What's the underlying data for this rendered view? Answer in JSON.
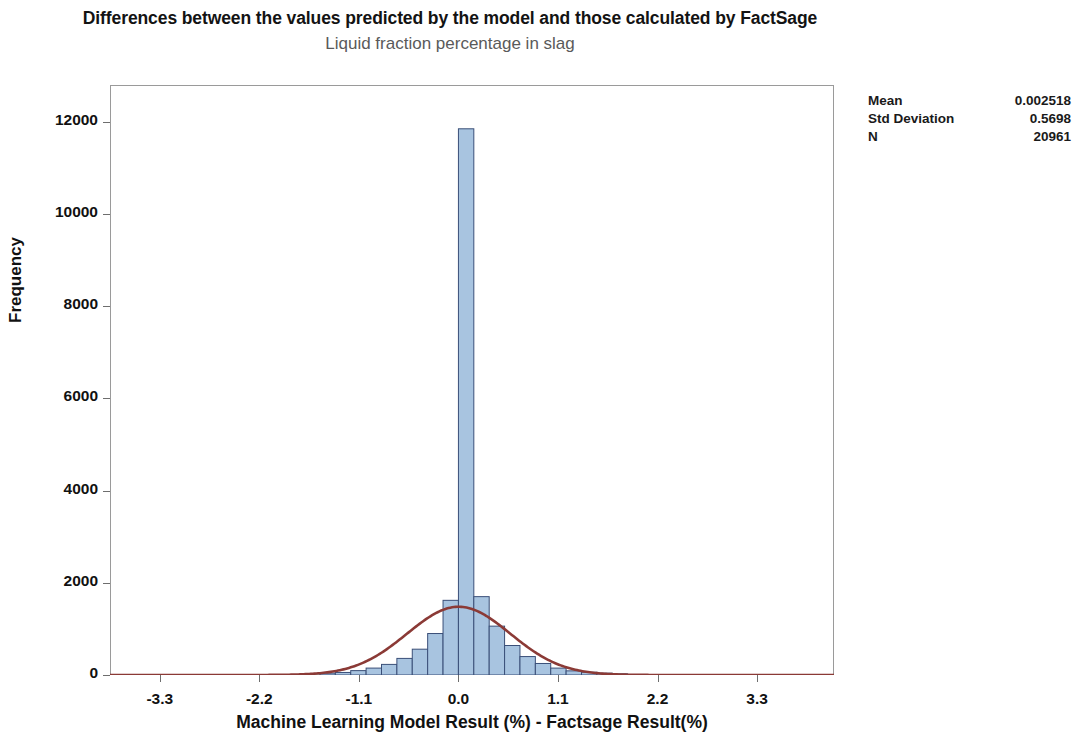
{
  "chart_data": {
    "type": "bar",
    "title": "Differences between the values predicted by the model and those calculated by FactSage",
    "subtitle": "Liquid fraction percentage in slag",
    "xlabel": "Machine Learning Model Result (%) - Factsage Result(%)",
    "ylabel": "Frequency",
    "xlim": [
      -3.85,
      4.15
    ],
    "ylim": [
      0,
      12800
    ],
    "grid": false,
    "legend": "none",
    "bar_color": "#A8C4E0",
    "bar_edge_color": "#3A4F78",
    "curve_color": "#8B3A36",
    "frame_color": "#9A9A9A",
    "xticks": [
      "-3.3",
      "-2.2",
      "-1.1",
      "0.0",
      "1.1",
      "2.2",
      "3.3"
    ],
    "xtick_values": [
      -3.3,
      -2.2,
      -1.1,
      0.0,
      1.1,
      2.2,
      3.3
    ],
    "yticks": [
      "0",
      "2000",
      "4000",
      "6000",
      "8000",
      "10000",
      "12000"
    ],
    "ytick_values": [
      0,
      2000,
      4000,
      6000,
      8000,
      10000,
      12000
    ],
    "bin_width": 0.17,
    "bin_centers": [
      -1.445,
      -1.275,
      -1.105,
      -0.935,
      -0.765,
      -0.595,
      -0.425,
      -0.255,
      -0.085,
      0.085,
      0.255,
      0.425,
      0.595,
      0.765,
      0.935,
      1.105,
      1.275,
      1.445,
      1.615,
      1.785
    ],
    "bin_left_edges": [
      -1.53,
      -1.36,
      -1.19,
      -1.02,
      -0.85,
      -0.68,
      -0.51,
      -0.34,
      -0.17,
      0.0,
      0.17,
      0.34,
      0.51,
      0.68,
      0.85,
      1.02,
      1.19,
      1.36,
      1.53,
      1.7
    ],
    "values": [
      40,
      55,
      95,
      150,
      230,
      360,
      560,
      900,
      1620,
      11850,
      1700,
      1060,
      640,
      400,
      250,
      150,
      90,
      60,
      40,
      25
    ],
    "normal_curve": {
      "label": "Normal fit",
      "mean": 0.002518,
      "std_dev": 0.5698,
      "peak_frequency": 1480,
      "color": "#8B3A36"
    }
  },
  "stats": {
    "rows": [
      {
        "label": "Mean",
        "value": "0.002518"
      },
      {
        "label": "Std Deviation",
        "value": "0.5698"
      },
      {
        "label": "N",
        "value": "20961"
      }
    ]
  }
}
